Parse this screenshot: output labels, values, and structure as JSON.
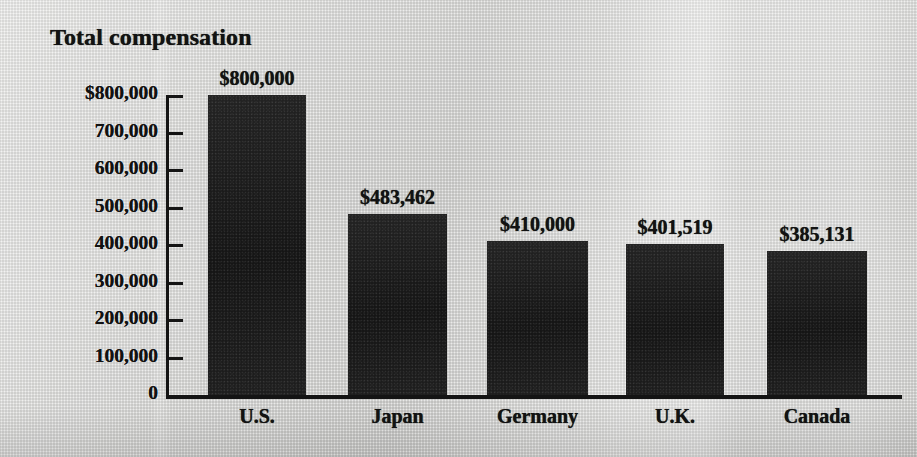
{
  "chart_data": {
    "type": "bar",
    "title": "Total compensation",
    "xlabel": "",
    "ylabel": "",
    "categories": [
      "U.S.",
      "Japan",
      "Germany",
      "U.K.",
      "Canada"
    ],
    "values": [
      800000,
      483462,
      410000,
      401519,
      385131
    ],
    "value_labels": [
      "$800,000",
      "$483,462",
      "$410,000",
      "$401,519",
      "$385,131"
    ],
    "ylim": [
      0,
      800000
    ],
    "ytick_values": [
      800000,
      700000,
      600000,
      500000,
      400000,
      300000,
      200000,
      100000,
      0
    ],
    "ytick_labels": [
      "$800,000",
      "700,000",
      "600,000",
      "500,000",
      "400,000",
      "300,000",
      "200,000",
      "100,000",
      "0"
    ],
    "grid": false,
    "legend": null,
    "legend_position": "none",
    "series": [
      {
        "name": "Total compensation",
        "values": [
          800000,
          483462,
          410000,
          401519,
          385131
        ]
      }
    ],
    "colors": {
      "bar_fill": "#171717",
      "axis": "#141414",
      "text": "#121212",
      "background": "#d9d9d7"
    }
  }
}
